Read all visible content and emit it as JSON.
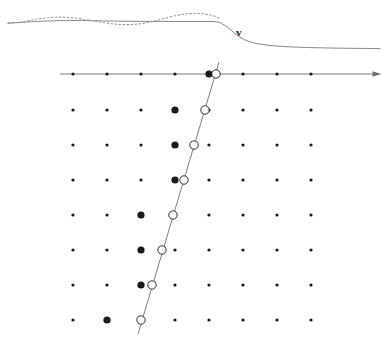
{
  "figure": {
    "width": 386,
    "height": 347,
    "background": "#ffffff",
    "ink_color": "#1a1a1a",
    "line_color": "#6e6e6e",
    "clipped_caption": "a an rarameter as us ras"
  },
  "top_panel": {
    "name": "velocity-profile-panel",
    "velocity_label": "v",
    "velocity_label_x": 236,
    "velocity_label_y": 26,
    "solid_curve": {
      "name": "solid-velocity-curve",
      "color": "#8a8a8a",
      "stroke_width": 1,
      "points": "8,23 20,22.4 34,21.6 50,20.8 68,20.4 88,20.6 108,21 130,21.3 152,21.4 176,21.5 200,21.5 214,21.5 220,22.5 226,26 232,31 238,36 246,40.5 256,43.5 270,45.5 288,46.8 310,47.6 334,48.1 360,48.4 380,48.6"
    },
    "dotted_curve": {
      "name": "dotted-oscillation-curve",
      "color": "#9a9a9a",
      "stroke_width": 1.1,
      "dash": "1.6 2.4",
      "points": "8,23.5 18,22.6 28,20.8 38,18.8 50,17.4 62,17.0 74,17.8 86,19.6 98,21.8 110,23.6 122,24.6 132,24.6 142,23.6 152,21.6 162,19.0 172,16.4 182,14.4 192,13.4 202,13.6 210,14.8 216,16.6 220,18.6"
    }
  },
  "lattice_panel": {
    "name": "dot-lattice-panel",
    "columns": 8,
    "rows": 8,
    "column_x": [
      73,
      107,
      141,
      175,
      209,
      243,
      277,
      311
    ],
    "row_y": [
      74,
      110,
      145,
      180,
      215,
      250,
      285,
      320
    ],
    "small_dot_radius": 1.6,
    "large_dot_radius": 3.6,
    "open_circle_radius": 4.2,
    "axis": {
      "name": "horizontal-axis-arrow",
      "y": 74,
      "x_start": 60,
      "x_end": 377,
      "color": "#6e6e6e",
      "stroke_width": 0.9,
      "arrow_size": 4.5
    },
    "slant_line": {
      "name": "slanted-trajectory-line",
      "x_top": 219,
      "y_top": 62,
      "x_bottom": 138,
      "y_bottom": 334,
      "color": "#6e6e6e",
      "stroke_width": 0.9
    },
    "large_dots": [
      {
        "row": 0,
        "col": 4
      },
      {
        "row": 1,
        "col": 3
      },
      {
        "row": 2,
        "col": 3
      },
      {
        "row": 3,
        "col": 3
      },
      {
        "row": 4,
        "col": 2
      },
      {
        "row": 5,
        "col": 2
      },
      {
        "row": 6,
        "col": 2
      },
      {
        "row": 7,
        "col": 1
      }
    ],
    "open_circles": [
      {
        "row": 0,
        "x": 216,
        "y": 74
      },
      {
        "row": 1,
        "x": 205,
        "y": 110
      },
      {
        "row": 2,
        "x": 194,
        "y": 145
      },
      {
        "row": 3,
        "x": 184,
        "y": 180
      },
      {
        "row": 4,
        "x": 173,
        "y": 215
      },
      {
        "row": 5,
        "x": 162,
        "y": 250
      },
      {
        "row": 6,
        "x": 152,
        "y": 285
      },
      {
        "row": 7,
        "x": 141,
        "y": 320
      }
    ]
  }
}
